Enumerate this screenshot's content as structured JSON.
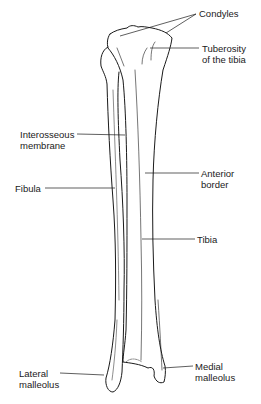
{
  "figure": {
    "labels": [
      {
        "id": "condyles",
        "lines": [
          "Condyles"
        ]
      },
      {
        "id": "tuberosity",
        "lines": [
          "Tuberosity",
          "of the tibia"
        ]
      },
      {
        "id": "interosseous",
        "lines": [
          "Interosseous",
          "membrane"
        ]
      },
      {
        "id": "fibula",
        "lines": [
          "Fibula"
        ]
      },
      {
        "id": "anterior-border",
        "lines": [
          "Anterior",
          "border"
        ]
      },
      {
        "id": "tibia",
        "lines": [
          "Tibia"
        ]
      },
      {
        "id": "lateral-malleolus",
        "lines": [
          "Lateral",
          "malleolus"
        ]
      },
      {
        "id": "medial-malleolus",
        "lines": [
          "Medial",
          "malleolus"
        ]
      }
    ],
    "colors": {
      "ink": "#1a1a1a",
      "background": "#ffffff"
    }
  }
}
